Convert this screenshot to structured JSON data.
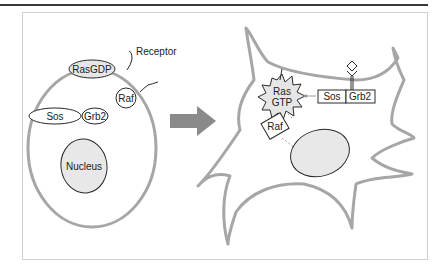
{
  "diagram": {
    "type": "biology-signaling",
    "left_panel": {
      "labels": {
        "receptor": "Receptor",
        "ras_gdp": "RasGDP",
        "raf": "Raf",
        "sos": "Sos",
        "grb2": "Grb2",
        "nucleus": "Nucleus"
      }
    },
    "arrow": {
      "direction": "right",
      "color": "#8a8a8a"
    },
    "right_panel": {
      "labels": {
        "ras": "Ras",
        "gtp": "GTP",
        "raf": "Raf",
        "sos": "Sos",
        "grb2": "Grb2"
      }
    },
    "colors": {
      "membrane": "#a6a6a6",
      "protein_fill": "#e6e6e6",
      "nucleus_fill": "#e8e8e8",
      "outline": "#2a2a2a",
      "frame": "#cfcfcf"
    }
  }
}
